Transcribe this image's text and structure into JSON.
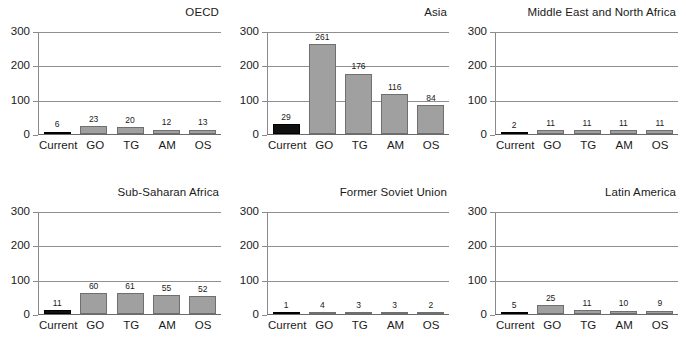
{
  "chart_data": {
    "type": "bar",
    "title": "",
    "categories": [
      "Current",
      "GO",
      "TG",
      "AM",
      "OS"
    ],
    "ylim": [
      0,
      300
    ],
    "yticks": [
      0,
      100,
      200,
      300
    ],
    "ytick_labels": [
      "0",
      "100",
      "200",
      "300"
    ],
    "xlabel": "",
    "ylabel": "",
    "grid": true,
    "legend": "none",
    "series_colors": {
      "current": "#101010",
      "scenario": "#a0a0a0"
    },
    "panels": [
      {
        "title": "OECD",
        "categories": [
          "Current",
          "GO",
          "TG",
          "AM",
          "OS"
        ],
        "values": [
          6,
          23,
          20,
          12,
          13
        ],
        "labels": [
          "6",
          "23",
          "20",
          "12",
          "13"
        ]
      },
      {
        "title": "Asia",
        "categories": [
          "Current",
          "GO",
          "TG",
          "AM",
          "OS"
        ],
        "values": [
          29,
          261,
          176,
          116,
          84
        ],
        "labels": [
          "29",
          "261",
          "176",
          "116",
          "84"
        ]
      },
      {
        "title": "Middle East and North Africa",
        "categories": [
          "Current",
          "GO",
          "TG",
          "AM",
          "OS"
        ],
        "values": [
          2,
          11,
          11,
          11,
          11
        ],
        "labels": [
          "2",
          "11",
          "11",
          "11",
          "11"
        ]
      },
      {
        "title": "Sub-Saharan Africa",
        "categories": [
          "Current",
          "GO",
          "TG",
          "AM",
          "OS"
        ],
        "values": [
          11,
          60,
          61,
          55,
          52
        ],
        "labels": [
          "11",
          "60",
          "61",
          "55",
          "52"
        ]
      },
      {
        "title": "Former Soviet Union",
        "categories": [
          "Current",
          "GO",
          "TG",
          "AM",
          "OS"
        ],
        "values": [
          1,
          4,
          3,
          3,
          2
        ],
        "labels": [
          "1",
          "4",
          "3",
          "3",
          "2"
        ]
      },
      {
        "title": "Latin America",
        "categories": [
          "Current",
          "GO",
          "TG",
          "AM",
          "OS"
        ],
        "values": [
          5,
          25,
          11,
          10,
          9
        ],
        "labels": [
          "5",
          "25",
          "11",
          "10",
          "9"
        ]
      }
    ]
  }
}
